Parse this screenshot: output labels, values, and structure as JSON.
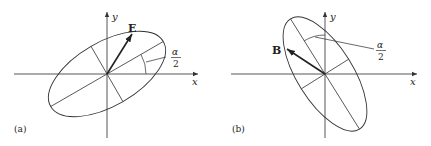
{
  "panels": [
    {
      "id": "a",
      "label": "(a)",
      "vector_label": "E",
      "angle_numerator": "α",
      "angle_denominator": "2",
      "x_axis_label": "x",
      "y_axis_label": "y"
    },
    {
      "id": "b",
      "label": "(b)",
      "vector_label": "B",
      "angle_numerator": "α",
      "angle_denominator": "2",
      "x_axis_label": "x",
      "y_axis_label": "y"
    }
  ],
  "colors": {
    "line": "#333333",
    "text": "#222222"
  }
}
